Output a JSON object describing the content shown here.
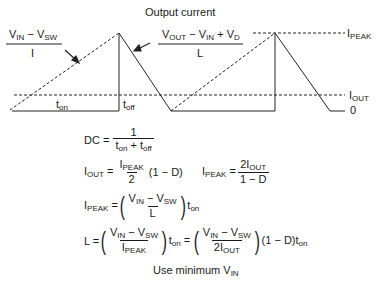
{
  "title": "Output current",
  "waveform": {
    "labels": {
      "rise_slope_num": [
        "V",
        "IN",
        " − V",
        "SW"
      ],
      "rise_slope_den": "I",
      "fall_slope_num": [
        "V",
        "OUT",
        " − V",
        "IN",
        " + V",
        "D"
      ],
      "fall_slope_den": "L",
      "ipeak": [
        "I",
        "PEAK"
      ],
      "iout": [
        "I",
        "OUT"
      ],
      "zero": "0",
      "ton": [
        "t",
        "on"
      ],
      "toff": [
        "t",
        "off"
      ]
    }
  },
  "equations": {
    "dc": {
      "lhs": "DC =",
      "num": "1",
      "den": [
        "t",
        "on",
        " + t",
        "off"
      ]
    },
    "iout": {
      "lhs": [
        "I",
        "OUT",
        " ="
      ],
      "num": [
        "I",
        "PEAK"
      ],
      "den": "2",
      "tail": "(1 − D)"
    },
    "ipeak_from_iout": {
      "lhs": [
        "I",
        "PEAK",
        " ="
      ],
      "num": [
        "2I",
        "OUT"
      ],
      "den": "1 − D"
    },
    "ipeak": {
      "lhs": [
        "I",
        "PEAK",
        " ="
      ],
      "num": [
        "V",
        "IN",
        " − V",
        "SW"
      ],
      "den": "L",
      "tail": [
        "t",
        "on"
      ]
    },
    "l": {
      "lhs": "L =",
      "num1": [
        "V",
        "IN",
        " − V",
        "SW"
      ],
      "den1": [
        "I",
        "PEAK"
      ],
      "mid": [
        "t",
        "on",
        " ="
      ],
      "num2": [
        "V",
        "IN",
        " − V",
        "SW"
      ],
      "den2": [
        "2I",
        "OUT"
      ],
      "tail": [
        "(1 − D)t",
        "on"
      ]
    },
    "note": [
      "Use minimum V",
      "IN"
    ]
  }
}
